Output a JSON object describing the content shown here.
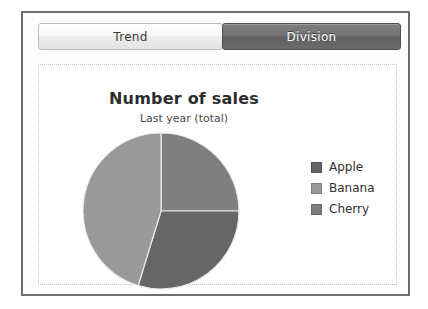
{
  "window": {
    "tabs": [
      {
        "label": "Trend",
        "state": "inactive"
      },
      {
        "label": "Division",
        "state": "active"
      }
    ]
  },
  "chart_data": {
    "type": "pie",
    "title": "Number of sales",
    "subtitle": "Last year (total)",
    "categories": [
      "Apple",
      "Banana",
      "Cherry"
    ],
    "values": [
      30,
      45,
      25
    ],
    "unit": "percent",
    "colors": [
      "#666666",
      "#999999",
      "#7f7f7f"
    ],
    "legend_position": "right",
    "start_angle_deg": 0,
    "direction": "clockwise",
    "slices": [
      {
        "label": "Cherry",
        "value": 25,
        "start_deg": 0,
        "end_deg": 90,
        "color": "#7f7f7f"
      },
      {
        "label": "Apple",
        "value": 30,
        "start_deg": 90,
        "end_deg": 197,
        "color": "#666666"
      },
      {
        "label": "Banana",
        "value": 45,
        "start_deg": 197,
        "end_deg": 360,
        "color": "#999999"
      }
    ],
    "grid": false,
    "xlabel": "",
    "ylabel": ""
  }
}
